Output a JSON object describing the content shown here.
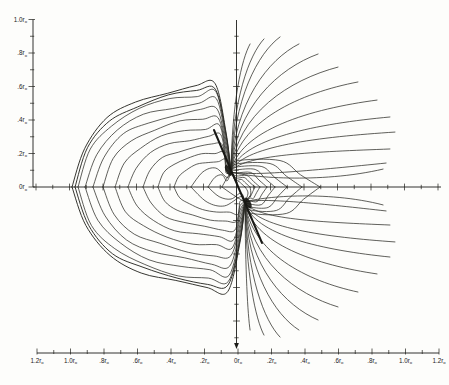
{
  "figure": {
    "background": "#fdfdfb",
    "line_color": "#2b2b26",
    "axis_color": "#1c1c18",
    "label_color": "#23231e"
  },
  "chart_data": {
    "type": "line",
    "title": "",
    "description_fields": "nested closed field-line lobes on left, open fan of field lines on right, dipole axis segment through origin",
    "x_axis": {
      "unit": "r",
      "unit_sub": "o",
      "tick_step": 0.1,
      "range": [
        -1.2,
        1.2
      ],
      "tick_labels": [
        "1.2",
        "1.0",
        ".8",
        ".6",
        ".4",
        ".2",
        "0",
        ".2",
        ".4",
        ".6",
        ".8",
        "1.0",
        "1.2"
      ]
    },
    "y_axis": {
      "unit": "r",
      "unit_sub": "o",
      "tick_step": 0.1,
      "range": [
        0,
        1.0
      ],
      "tick_labels": [
        "1.0",
        ".8",
        ".6",
        ".4",
        ".2",
        "0"
      ]
    },
    "calibration": {
      "origin_px": [
        237,
        187
      ],
      "px_per_r0": 167.5,
      "left_ruler_x": 33,
      "left_ruler_top_y": 19.5,
      "bottom_ruler_y": 353,
      "bottom_ruler_x0": 37,
      "v_axis": {
        "x": 236.5,
        "y0": 20,
        "y1": 346
      },
      "h_axis": {
        "y": 187,
        "x0": 33,
        "x1": 441
      }
    },
    "poles": {
      "upper": [
        -0.036,
        0.09
      ],
      "lower": [
        0.048,
        -0.09
      ]
    },
    "dipole_axis": [
      [
        -0.137,
        0.34
      ],
      [
        0.149,
        -0.334
      ]
    ],
    "closed_lobes_left": {
      "x": [
        -0.985,
        -0.967,
        -0.949,
        -0.907,
        -0.86,
        -0.8,
        -0.728,
        -0.651,
        -0.561,
        -0.472,
        -0.376,
        -0.275,
        -0.173,
        -0.09
      ],
      "h": [
        0.597,
        0.573,
        0.549,
        0.501,
        0.454,
        0.406,
        0.352,
        0.299,
        0.251,
        0.203,
        0.155,
        0.113,
        0.072,
        0.042
      ]
    },
    "closed_loops_right": {
      "x": [
        0.048,
        0.078,
        0.107,
        0.137,
        0.179,
        0.227,
        0.299,
        0.388,
        0.496
      ],
      "h": [
        0.024,
        0.036,
        0.048,
        0.06,
        0.078,
        0.096,
        0.113,
        0.131,
        0.149
      ]
    },
    "open_fan_endpoints_upper": [
      [
        0.078,
        0.854
      ],
      [
        0.161,
        0.884
      ],
      [
        0.257,
        0.896
      ],
      [
        0.37,
        0.854
      ],
      [
        0.484,
        0.794
      ],
      [
        0.603,
        0.716
      ],
      [
        0.722,
        0.627
      ],
      [
        0.836,
        0.519
      ],
      [
        0.913,
        0.418
      ],
      [
        0.943,
        0.328
      ],
      [
        0.913,
        0.227
      ],
      [
        0.89,
        0.143
      ],
      [
        0.872,
        0.107
      ]
    ],
    "open_fan_sag": [
      0,
      0,
      0,
      0,
      0,
      0,
      0,
      0,
      0,
      0,
      0,
      0.04,
      0.09
    ]
  }
}
